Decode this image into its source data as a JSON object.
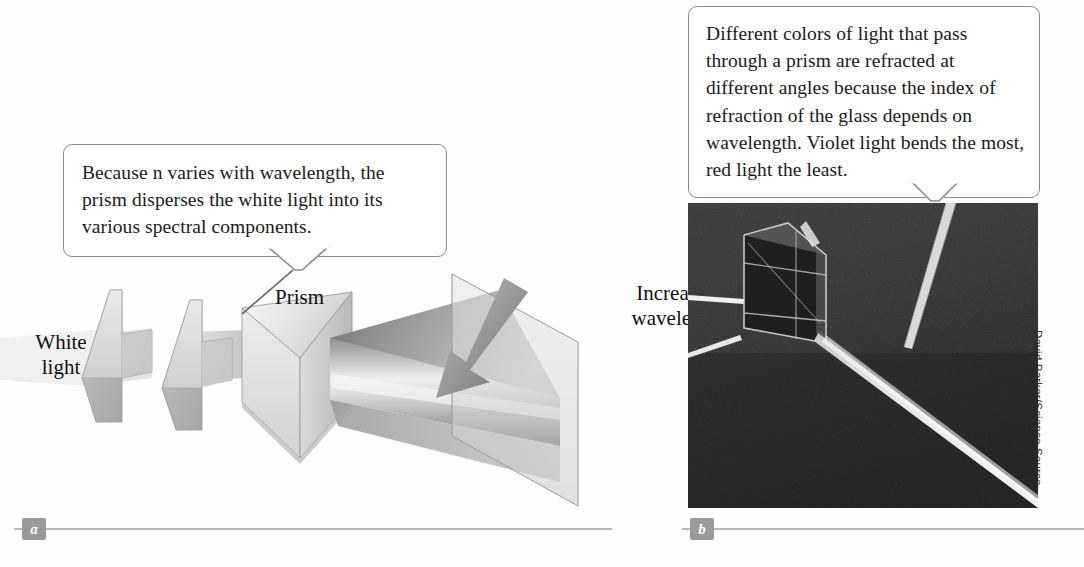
{
  "figure": {
    "panel_a": {
      "badge": "a",
      "callout_text": "Because n varies with wavelength, the prism disperses the white light into its various spectral components.",
      "labels": {
        "white_light": "White\nlight",
        "prism": "Prism",
        "increasing_wavelength": "Increasing\nwavelength"
      }
    },
    "panel_b": {
      "badge": "b",
      "callout_text": "Different colors of light that pass through a prism are refracted at different angles because the index of refraction of the glass depends on wavelength. Violet light bends the most, red light the least.",
      "credit": "David Parker/Science Source"
    }
  },
  "colors": {
    "page_background": "#fefefe",
    "callout_border": "#8a8a8a",
    "callout_background": "#ffffff",
    "text": "#1a1a1a",
    "badge_background": "#9a9a9a",
    "badge_text": "#ffffff",
    "rule": "#b9b9b9",
    "prism_light": "#f2f2f2",
    "prism_mid": "#cfcfcf",
    "prism_dark": "#9b9b9b",
    "beam_gray": "#c8c8c8",
    "arrow_gray": "#7f7f7f",
    "photo_dark": "#2e2e2e",
    "photo_beam": "#f5f5f5"
  }
}
